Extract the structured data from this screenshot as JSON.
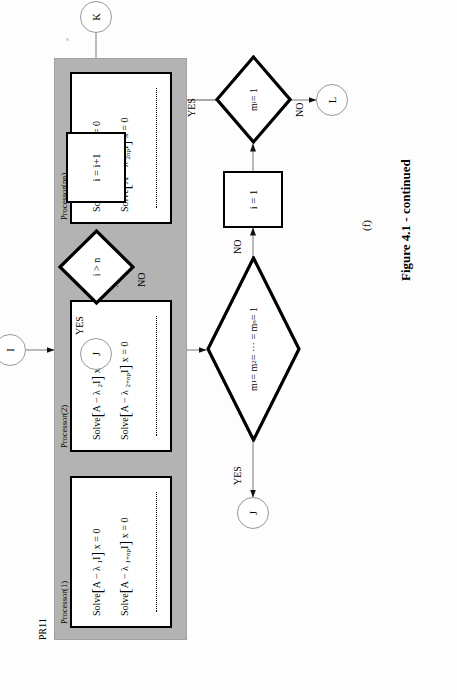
{
  "figure": {
    "panel_label": "PR11",
    "subfigure_label": "(f)",
    "caption": "Figure 4.1 - continued",
    "gray_color": "#b3b3b3"
  },
  "processors": [
    {
      "title": "Processor(1)",
      "equations": [
        {
          "prefix": "Solve",
          "matrix": "A − λ",
          "sub": "1",
          "tail": "I",
          "rhs": "x = 0"
        },
        {
          "prefix": "Solve",
          "matrix": "A − λ",
          "sub": "1+np",
          "tail": "I",
          "rhs": "x = 0"
        }
      ],
      "vdots": "⋮"
    },
    {
      "title": "Processor(2)",
      "equations": [
        {
          "prefix": "Solve",
          "matrix": "A − λ",
          "sub": "2",
          "tail": "I",
          "rhs": "x = 0"
        },
        {
          "prefix": "Solve",
          "matrix": "A − λ",
          "sub": "2+np",
          "tail": "I",
          "rhs": "x = 0"
        }
      ],
      "vdots": "⋮"
    },
    {
      "title": "Processor(np)",
      "equations": [
        {
          "prefix": "Solve",
          "matrix": "A − λ",
          "sub": "np",
          "tail": "I",
          "rhs": "x = 0"
        },
        {
          "prefix": "Solve",
          "matrix": "A − λ",
          "sub": "2np",
          "tail": "I",
          "rhs": "x = 0"
        }
      ],
      "vdots": "⋮"
    }
  ],
  "panel_ellipsis": "········",
  "connectors": {
    "entry_I": "I",
    "exit_J_left": "J",
    "exit_J_top": "J",
    "exit_L": "L",
    "entry_K": "K"
  },
  "nodes": {
    "increment": "i = i+1",
    "init": "i = 1"
  },
  "decisions": [
    {
      "id": "all-multiplicities-one",
      "text_html": "m<sub>1</sub> = m<sub>2</sub> = ⋯ = m<sub>n</sub> = 1",
      "yes": "YES",
      "no": "NO"
    },
    {
      "id": "i-greater-n",
      "text_html": "i > n",
      "yes": "YES",
      "no": "NO"
    },
    {
      "id": "mi-equals-one",
      "text_html": "m<sub>i</sub> = 1",
      "yes": "YES",
      "no": "NO"
    }
  ],
  "edge_labels": {
    "big_diamond_yes": "YES",
    "big_diamond_no": "NO",
    "i_gt_n_yes": "YES",
    "i_gt_n_no": "NO",
    "mi_yes": "YES",
    "mi_no": "NO"
  }
}
